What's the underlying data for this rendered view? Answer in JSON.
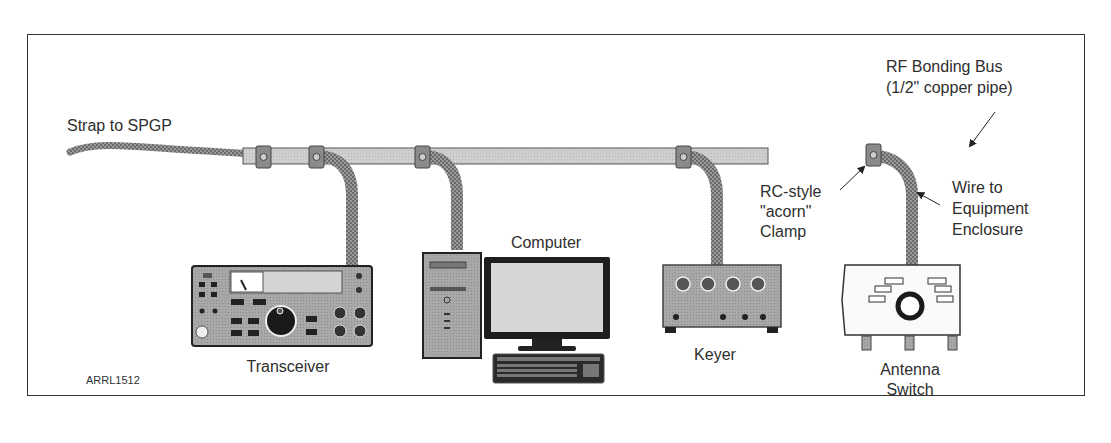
{
  "figure_code": "ARRL1512",
  "labels": {
    "strap": "Strap to SPGP",
    "bus_line1": "RF Bonding Bus",
    "bus_line2": "(1/2\" copper pipe)",
    "clamp_line1": "RC-style",
    "clamp_line2": "\"acorn\"",
    "clamp_line3": "Clamp",
    "wire_line1": "Wire to",
    "wire_line2": "Equipment",
    "wire_line3": "Enclosure"
  },
  "equipment": [
    {
      "name": "Transceiver"
    },
    {
      "name": "Computer"
    },
    {
      "name": "Keyer"
    },
    {
      "name_line1": "Antenna",
      "name_line2": "Switch"
    }
  ],
  "colors": {
    "bus_fill": "#c8c8c8",
    "braid": "#8a8a8a",
    "equipment_fill": "#9a9a9a",
    "dark": "#2a2a2a",
    "frame": "#333333"
  }
}
